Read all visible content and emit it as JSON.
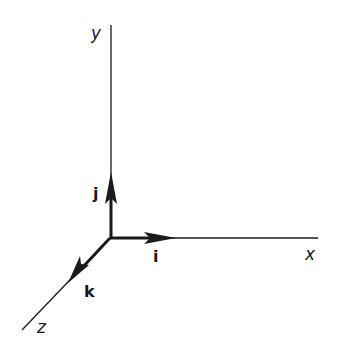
{
  "diagram": {
    "colors": {
      "stroke": "#1a1a1a",
      "background": "#ffffff"
    },
    "origin": [
      110,
      238
    ],
    "axes": {
      "x": {
        "label": "x",
        "end": [
          318,
          238
        ]
      },
      "y": {
        "label": "y",
        "end": [
          111,
          25
        ]
      },
      "z": {
        "label": "z",
        "end": [
          22,
          330
        ]
      }
    },
    "unit_vectors": {
      "i": {
        "label": "i",
        "tip": [
          176,
          238
        ]
      },
      "j": {
        "label": "j",
        "tip": [
          111,
          172
        ]
      },
      "k": {
        "label": "k",
        "tip": [
          68,
          283
        ]
      }
    }
  }
}
